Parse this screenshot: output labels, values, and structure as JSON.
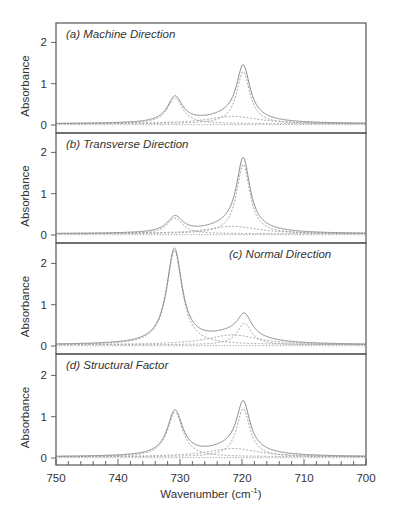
{
  "chart_data": {
    "type": "line",
    "layout": "4 vertically stacked panels sharing x-axis",
    "xlabel": "Wavenumber (cm-1)",
    "xlabel_parts": {
      "main": "Wavenumber (cm",
      "sup": "-1",
      "close": ")"
    },
    "ylabel": "Absorbance",
    "xlim": [
      750,
      700
    ],
    "x_reversed": true,
    "x_ticks": [
      750,
      740,
      730,
      720,
      710,
      700
    ],
    "x_minor_step": 2,
    "y_ticks": [
      0,
      1,
      2
    ],
    "grid": false,
    "legend": "none",
    "line_styles": {
      "total": "solid gray",
      "components": "dashed gray",
      "baseline": "dotted gray"
    },
    "panels": [
      {
        "id": "a",
        "title": "(a) Machine Direction",
        "title_position": "top-left",
        "ylim": [
          -0.15,
          2.45
        ],
        "peaks": [
          {
            "center": 730.8,
            "height": 0.62,
            "hwhm": 1.5,
            "type": "component"
          },
          {
            "center": 719.8,
            "height": 1.26,
            "hwhm": 1.3,
            "type": "component"
          },
          {
            "center": 721.5,
            "height": 0.18,
            "hwhm": 5.0,
            "type": "broad"
          }
        ],
        "baseline": 0.03,
        "observed_maxima": [
          {
            "x": 731,
            "y": 0.68
          },
          {
            "x": 720,
            "y": 1.46
          }
        ]
      },
      {
        "id": "b",
        "title": "(b) Transverse Direction",
        "title_position": "top-left",
        "ylim": [
          -0.15,
          2.45
        ],
        "peaks": [
          {
            "center": 730.8,
            "height": 0.38,
            "hwhm": 1.5,
            "type": "component"
          },
          {
            "center": 719.8,
            "height": 1.68,
            "hwhm": 1.3,
            "type": "component"
          },
          {
            "center": 721.5,
            "height": 0.18,
            "hwhm": 5.0,
            "type": "broad"
          }
        ],
        "baseline": 0.03,
        "observed_maxima": [
          {
            "x": 731,
            "y": 0.45
          },
          {
            "x": 720,
            "y": 1.87
          }
        ]
      },
      {
        "id": "c",
        "title": "(c) Normal Direction",
        "title_position": "top-right",
        "ylim": [
          -0.15,
          2.45
        ],
        "peaks": [
          {
            "center": 730.9,
            "height": 2.28,
            "hwhm": 1.5,
            "type": "component"
          },
          {
            "center": 719.6,
            "height": 0.52,
            "hwhm": 1.4,
            "type": "component"
          },
          {
            "center": 721.5,
            "height": 0.24,
            "hwhm": 5.0,
            "type": "broad"
          }
        ],
        "baseline": 0.03,
        "observed_maxima": [
          {
            "x": 731,
            "y": 2.38
          },
          {
            "x": 720,
            "y": 0.87
          }
        ]
      },
      {
        "id": "d",
        "title": "(d) Structural Factor",
        "title_position": "top-left",
        "ylim": [
          -0.15,
          2.45
        ],
        "peaks": [
          {
            "center": 730.8,
            "height": 1.08,
            "hwhm": 1.5,
            "type": "component"
          },
          {
            "center": 719.8,
            "height": 1.16,
            "hwhm": 1.3,
            "type": "component"
          },
          {
            "center": 721.5,
            "height": 0.2,
            "hwhm": 5.0,
            "type": "broad"
          }
        ],
        "baseline": 0.03,
        "observed_maxima": [
          {
            "x": 731,
            "y": 1.17
          },
          {
            "x": 720,
            "y": 1.38
          }
        ]
      }
    ]
  }
}
